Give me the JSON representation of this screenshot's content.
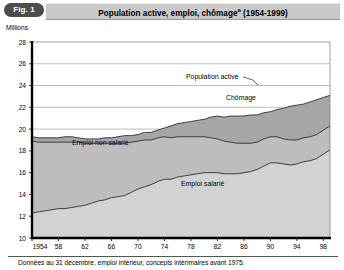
{
  "figure": {
    "badge_label": "Fig. 1",
    "title": "Population active, emploi, chômage",
    "title_superscript": "a",
    "title_period": "(1954-1999)",
    "unit_label": "Millions",
    "footnote": "Données au 31 décembre, emploi intérieur, concepts intérimaires avant 1975."
  },
  "labels": {
    "population_active": "Population active",
    "chomage": "Chômage",
    "emploi_non_salarie": "Emploi non salarié",
    "emploi_salarie": "Emploi salarié"
  },
  "colors": {
    "band_chomage": "#a6a6a6",
    "band_emploi_non_salarie": "#bdbdbd",
    "band_emploi_salarie": "#d2d2d2",
    "plot_background": "#ffffff",
    "axis": "#000000",
    "grid": "#909090",
    "title_bar": "#c9c9c9",
    "badge": "#4c4c4c"
  },
  "chart_data": {
    "type": "area",
    "stacked": true,
    "xlabel": "",
    "ylabel": "Millions",
    "ylim": [
      10,
      28
    ],
    "xlim": [
      1954,
      1999
    ],
    "ytick_step": 2,
    "yticks": [
      10,
      12,
      14,
      16,
      18,
      20,
      22,
      24,
      26,
      28
    ],
    "ytick_labels": [
      "10",
      "12",
      "14",
      "16",
      "18",
      "20",
      "22",
      "24",
      "26",
      "28"
    ],
    "xticks": [
      1954,
      1958,
      1962,
      1966,
      1970,
      1974,
      1978,
      1982,
      1986,
      1990,
      1994,
      1998
    ],
    "xtick_labels": [
      "1954",
      "58",
      "62",
      "66",
      "70",
      "74",
      "78",
      "82",
      "86",
      "90",
      "94",
      "98"
    ],
    "grid": "horizontal",
    "legend_position": "inline-annotations",
    "annotations": [
      {
        "text": "Population active",
        "x": 1982,
        "y": 24.3,
        "leader": true
      },
      {
        "text": "Chômage",
        "x": 1988,
        "y": 22.6,
        "leader": false
      },
      {
        "text": "Emploi non salarié",
        "x": 1966,
        "y": 17.6,
        "leader": false
      },
      {
        "text": "Emploi salarié",
        "x": 1982,
        "y": 14.6,
        "leader": false
      }
    ],
    "x": [
      1954,
      1955,
      1956,
      1957,
      1958,
      1959,
      1960,
      1961,
      1962,
      1963,
      1964,
      1965,
      1966,
      1967,
      1968,
      1969,
      1970,
      1971,
      1972,
      1973,
      1974,
      1975,
      1976,
      1977,
      1978,
      1979,
      1980,
      1981,
      1982,
      1983,
      1984,
      1985,
      1986,
      1987,
      1988,
      1989,
      1990,
      1991,
      1992,
      1993,
      1994,
      1995,
      1996,
      1997,
      1998,
      1999
    ],
    "series": [
      {
        "name": "Emploi salarié",
        "color": "#d2d2d2",
        "values": [
          12.3,
          12.4,
          12.5,
          12.6,
          12.7,
          12.7,
          12.8,
          12.9,
          13.0,
          13.2,
          13.4,
          13.5,
          13.7,
          13.8,
          13.9,
          14.2,
          14.5,
          14.7,
          14.9,
          15.2,
          15.4,
          15.4,
          15.6,
          15.7,
          15.8,
          15.9,
          16.0,
          16.0,
          16.0,
          15.9,
          15.9,
          15.9,
          16.0,
          16.1,
          16.3,
          16.6,
          16.9,
          16.9,
          16.8,
          16.7,
          16.8,
          17.0,
          17.1,
          17.3,
          17.7,
          18.1
        ]
      },
      {
        "name": "Emploi non salarié",
        "color": "#bdbdbd",
        "values": [
          6.6,
          6.4,
          6.3,
          6.2,
          6.1,
          6.1,
          6.0,
          5.9,
          5.7,
          5.5,
          5.3,
          5.2,
          5.0,
          4.9,
          4.8,
          4.6,
          4.4,
          4.3,
          4.1,
          4.0,
          3.9,
          3.8,
          3.7,
          3.6,
          3.5,
          3.4,
          3.3,
          3.2,
          3.1,
          3.0,
          2.9,
          2.8,
          2.7,
          2.6,
          2.5,
          2.5,
          2.4,
          2.4,
          2.3,
          2.3,
          2.2,
          2.2,
          2.2,
          2.2,
          2.2,
          2.2
        ]
      },
      {
        "name": "Chômage",
        "color": "#a6a6a6",
        "values": [
          0.4,
          0.4,
          0.4,
          0.4,
          0.4,
          0.5,
          0.5,
          0.4,
          0.4,
          0.4,
          0.4,
          0.5,
          0.5,
          0.6,
          0.7,
          0.6,
          0.6,
          0.7,
          0.7,
          0.7,
          0.8,
          1.1,
          1.2,
          1.3,
          1.4,
          1.5,
          1.6,
          1.9,
          2.1,
          2.2,
          2.4,
          2.5,
          2.5,
          2.6,
          2.5,
          2.4,
          2.3,
          2.5,
          2.8,
          3.1,
          3.2,
          3.1,
          3.2,
          3.2,
          3.0,
          2.8
        ]
      }
    ],
    "total_series": {
      "name": "Population active",
      "values": [
        19.3,
        19.2,
        19.2,
        19.2,
        19.2,
        19.3,
        19.3,
        19.2,
        19.1,
        19.1,
        19.1,
        19.2,
        19.2,
        19.3,
        19.4,
        19.4,
        19.5,
        19.7,
        19.7,
        19.9,
        20.1,
        20.3,
        20.5,
        20.6,
        20.7,
        20.8,
        20.9,
        21.1,
        21.2,
        21.1,
        21.2,
        21.2,
        21.2,
        21.3,
        21.3,
        21.5,
        21.6,
        21.8,
        21.9,
        22.1,
        22.2,
        22.3,
        22.5,
        22.7,
        22.9,
        23.1
      ]
    }
  }
}
